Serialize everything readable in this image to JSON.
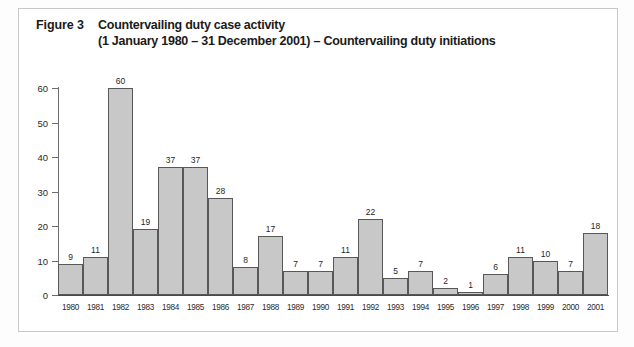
{
  "figure": {
    "label": "Figure 3",
    "title_line_1": "Countervailing duty case activity",
    "title_line_2": "(1 January 1980 – 31 December 2001) – Countervailing duty initiations"
  },
  "colors": {
    "bar_fill": "#c8c8c8",
    "bar_stroke": "#585858",
    "axis": "#4a4a4a",
    "text": "#1b1b1b",
    "frame": "#c9c9c9",
    "page_background": "#fdfdfd",
    "plot_background": "#ffffff"
  },
  "chart_data": {
    "type": "bar",
    "title": "Countervailing duty case activity (1 January 1980 – 31 December 2001) – Countervailing duty initiations",
    "xlabel": "",
    "ylabel": "",
    "categories": [
      "1980",
      "1981",
      "1982",
      "1983",
      "1984",
      "1985",
      "1986",
      "1987",
      "1988",
      "1989",
      "1990",
      "1991",
      "1992",
      "1993",
      "1994",
      "1995",
      "1996",
      "1997",
      "1998",
      "1999",
      "2000",
      "2001"
    ],
    "values": [
      9,
      11,
      60,
      19,
      37,
      37,
      28,
      8,
      17,
      7,
      7,
      11,
      22,
      5,
      7,
      2,
      1,
      6,
      11,
      10,
      7,
      18
    ],
    "ylim": [
      0,
      60
    ],
    "yticks": [
      0,
      10,
      20,
      30,
      40,
      50,
      60
    ],
    "ytick_labels": [
      "0",
      "10",
      "20",
      "30",
      "40",
      "50",
      "60"
    ],
    "grid": false,
    "legend": null,
    "data_labels": true,
    "bar_gap": 0
  }
}
